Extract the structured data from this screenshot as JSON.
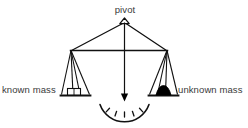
{
  "diagram": {
    "title_label": "pivot",
    "left_label": "known mass",
    "right_label": "unknown mass",
    "line_color": "#111111",
    "fill_color": "#000000",
    "background_color": "#ffffff",
    "text_color": "#3a3a3a",
    "parts": {
      "pivot_marker": "pivot-triangle",
      "beam": "horizontal-beam",
      "pointer": "vertical-pointer-arrow",
      "left_pan": "left-pan-trapezoid",
      "right_pan": "right-pan-trapezoid",
      "left_mass": "outlined-block-weight",
      "right_mass": "solid-black-mound",
      "scale_arc": "graduated-arc-with-ticks"
    },
    "arc_tick_count": 5
  }
}
